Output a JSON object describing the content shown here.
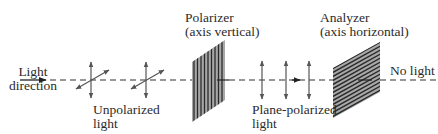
{
  "labels": {
    "light_direction": [
      "Light",
      "direction"
    ],
    "unpolarized": [
      "Unpolarized",
      "light"
    ],
    "polarizer": [
      "Polarizer",
      "(axis vertical)"
    ],
    "plane_polarized": [
      "Plane-polarized",
      "light"
    ],
    "analyzer": [
      "Analyzer",
      "(axis horizontal)"
    ],
    "no_light": "No light"
  },
  "colors": {
    "line": "#3a3a3a",
    "arrow": "#555555",
    "filter_fill": "#9a9a9a",
    "filter_stripe": "#2a2a2a",
    "text": "#2b2b2b"
  }
}
